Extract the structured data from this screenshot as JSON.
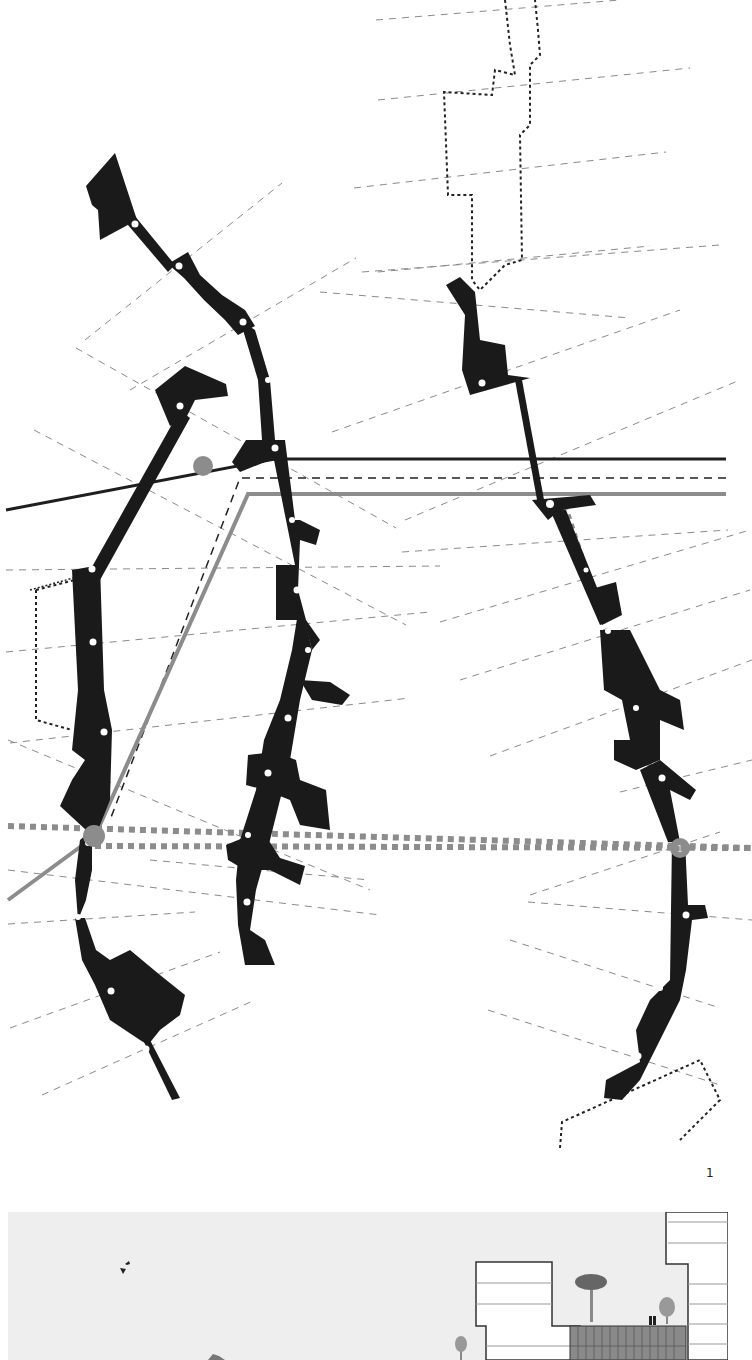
{
  "figure": {
    "number_label": "1",
    "type": "urban plan diagram with pedestrian routes and section elevation"
  },
  "colors": {
    "background": "#ffffff",
    "building_fill": "#1a1a1a",
    "secondary_building_fill": "#333333",
    "guide_dash": "#8a8a8a",
    "route_gray": "#8c8c8c",
    "route_dark": "#1e1e1e",
    "node_circle_gray": "#8c8c8c",
    "node_dot": "#ffffff",
    "elevation_sky": "#eeeeee",
    "facade_gray": "#8a8a8a"
  },
  "markers": [
    {
      "id": "gray-node-top",
      "label": ""
    },
    {
      "id": "gray-node-left",
      "label": ""
    },
    {
      "id": "gray-node-right",
      "label": "1"
    }
  ],
  "legend_lines": [
    {
      "style": "solid-dark",
      "name": "route-dark"
    },
    {
      "style": "dashed-dark",
      "name": "route-dashed"
    },
    {
      "style": "solid-gray",
      "name": "route-gray"
    },
    {
      "style": "dotted-gray-squares",
      "name": "route-dotted"
    }
  ]
}
